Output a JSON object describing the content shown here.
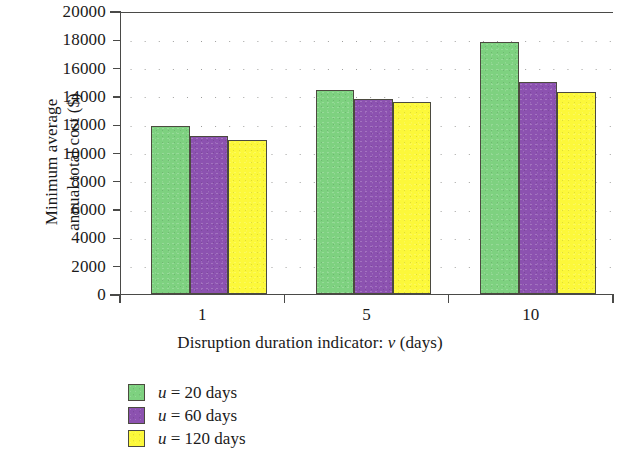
{
  "chart_data": {
    "type": "bar",
    "title": "",
    "xlabel": "Disruption duration indicator: v (days)",
    "xlabel_parts": {
      "prefix": "Disruption duration indicator: ",
      "italic": "v",
      "suffix": " (days)"
    },
    "ylabel": "Minimum average\nannual total cost ($)",
    "categories": [
      "1",
      "5",
      "10"
    ],
    "series": [
      {
        "name": "u = 20 days",
        "color": "#7ed180",
        "values": [
          11850,
          14450,
          17800
        ]
      },
      {
        "name": "u = 60 days",
        "color": "#8c52b0",
        "values": [
          11150,
          13750,
          14950
        ]
      },
      {
        "name": "u = 120 days",
        "color": "#fcf83a",
        "values": [
          10850,
          13600,
          14300
        ]
      }
    ],
    "ylim": [
      0,
      20000
    ],
    "ytick_step": 2000,
    "yticks": [
      0,
      2000,
      4000,
      6000,
      8000,
      10000,
      12000,
      14000,
      16000,
      18000,
      20000
    ],
    "ytick_labels": [
      "0",
      "2000",
      "4000",
      "6000",
      "8000",
      "10000",
      "12000",
      "14000",
      "16000",
      "18000",
      "20000"
    ],
    "grid": "dotted-horizontal",
    "legend_position": "below-left"
  },
  "legend": {
    "entries": [
      {
        "var": "u",
        "eq": " = ",
        "value": "20 days"
      },
      {
        "var": "u",
        "eq": " = ",
        "value": "60 days"
      },
      {
        "var": "u",
        "eq": " = ",
        "value": "120 days"
      }
    ]
  },
  "axes": {
    "y_title_line1": "Minimum average",
    "y_title_line2": "annual total cost ($)",
    "x_title_prefix": "Disruption duration indicator:",
    "x_title_var": "v",
    "x_title_suffix": "(days)"
  }
}
